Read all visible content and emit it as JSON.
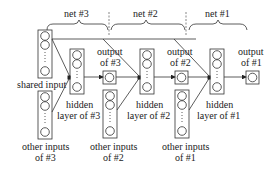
{
  "nets": [
    {
      "label": "net #3"
    },
    {
      "label": "net #2"
    },
    {
      "label": "net #1"
    }
  ],
  "labels": {
    "shared_input": "shared input",
    "hidden3_line1": "hidden",
    "hidden3_line2": "layer of #3",
    "hidden2_line1": "hidden",
    "hidden2_line2": "layer of #2",
    "hidden1_line1": "hidden",
    "hidden1_line2": "layer of #1",
    "output3_line1": "output",
    "output3_line2": "of #3",
    "output2_line1": "output",
    "output2_line2": "of #2",
    "output1_line1": "output",
    "output1_line2": "of #1",
    "other3_line1": "other inputs",
    "other3_line2": "of #3",
    "other2_line1": "other inputs",
    "other2_line2": "of #2",
    "other1_line1": "other inputs",
    "other1_line2": "of #1"
  },
  "colors": {
    "stroke": "#333333",
    "background": "#ffffff"
  }
}
